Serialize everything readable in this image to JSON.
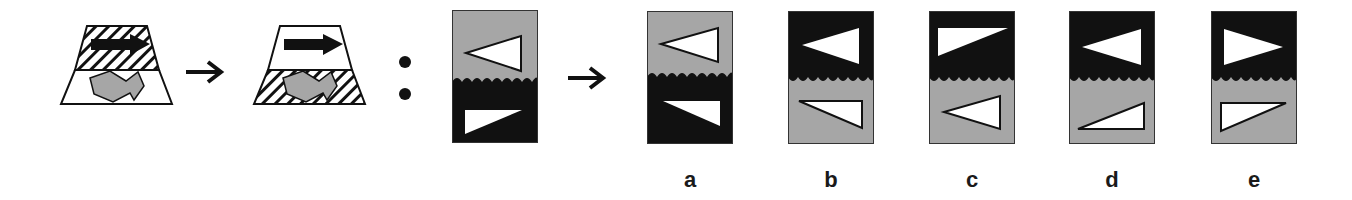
{
  "puzzle": {
    "type": "visual-analogy",
    "separator": ":",
    "colors": {
      "black": "#111111",
      "gray": "#a6a6a6",
      "white": "#ffffff",
      "outline": "#222222"
    },
    "example": {
      "left": {
        "name": "trapezoid-before",
        "top": "hatched with black arrow",
        "bottom": "white with gray zigzag arrow"
      },
      "right": {
        "name": "trapezoid-after",
        "top": "white with black arrow",
        "bottom": "hatched with gray zigzag arrow"
      }
    },
    "question": {
      "top": "gray with outlined left-pointing triangle",
      "bottom": "black with white right-angled triangle"
    },
    "options": [
      {
        "label": "a",
        "top_fill": "gray",
        "bottom_fill": "black"
      },
      {
        "label": "b",
        "top_fill": "black",
        "bottom_fill": "gray"
      },
      {
        "label": "c",
        "top_fill": "black",
        "bottom_fill": "gray"
      },
      {
        "label": "d",
        "top_fill": "black",
        "bottom_fill": "gray"
      },
      {
        "label": "e",
        "top_fill": "black",
        "bottom_fill": "gray"
      }
    ]
  }
}
